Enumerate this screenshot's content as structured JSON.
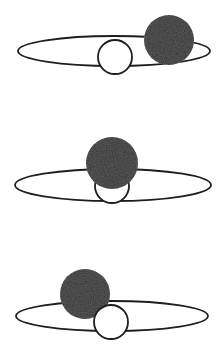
{
  "diagram": {
    "colors": {
      "background": "#ffffff",
      "stroke": "#1e1e1e",
      "planet_fill": "#5a5a5a",
      "planet_texture_dark": "#3a3a3a",
      "planet_texture_light": "#8a8a8a",
      "disk_fill": "#ffffff"
    },
    "panels": [
      {
        "id": "stage-1",
        "orbit": {
          "cx": 114,
          "cy": 51,
          "rx": 96,
          "ry": 15
        },
        "disk": {
          "cx": 115,
          "cy": 57,
          "r": 17
        },
        "planet": {
          "cx": 169,
          "cy": 40,
          "r": 25
        },
        "planet_in_front": true
      },
      {
        "id": "stage-2",
        "orbit": {
          "cx": 113,
          "cy": 185,
          "rx": 98,
          "ry": 16
        },
        "disk": {
          "cx": 112,
          "cy": 186,
          "r": 17
        },
        "planet": {
          "cx": 112,
          "cy": 163,
          "r": 26
        },
        "planet_in_front": true
      },
      {
        "id": "stage-3",
        "orbit": {
          "cx": 112,
          "cy": 316,
          "rx": 96,
          "ry": 15
        },
        "disk": {
          "cx": 111,
          "cy": 322,
          "r": 17
        },
        "planet": {
          "cx": 85,
          "cy": 294,
          "r": 25
        },
        "planet_in_front": false
      }
    ]
  }
}
